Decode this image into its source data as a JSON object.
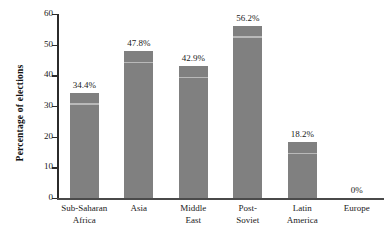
{
  "chart_data": {
    "type": "bar",
    "title": "",
    "xlabel": "",
    "ylabel": "Percentage of elections",
    "categories": [
      "Sub-Saharan Africa",
      "Asia",
      "Middle East",
      "Post-Soviet",
      "Latin America",
      "Europe"
    ],
    "category_lines": [
      [
        "Sub-Saharan",
        "Africa"
      ],
      [
        "Asia"
      ],
      [
        "Middle",
        "East"
      ],
      [
        "Post-",
        "Soviet"
      ],
      [
        "Latin",
        "America"
      ],
      [
        "Europe"
      ]
    ],
    "values": [
      34.4,
      47.8,
      42.9,
      56.2,
      18.2,
      0
    ],
    "value_labels": [
      "34.4%",
      "47.8%",
      "42.9%",
      "56.2%",
      "18.2%",
      "0%"
    ],
    "ylim": [
      0,
      60
    ],
    "yticks": [
      0,
      10,
      20,
      30,
      40,
      50,
      60
    ],
    "ytick_labels": [
      "0",
      "10",
      "20",
      "30",
      "40",
      "50",
      "60"
    ],
    "grid": false,
    "legend": null,
    "bar_color": "#808080",
    "axis_color": "#2b2b2b",
    "text_color": "#1a1a1a"
  }
}
